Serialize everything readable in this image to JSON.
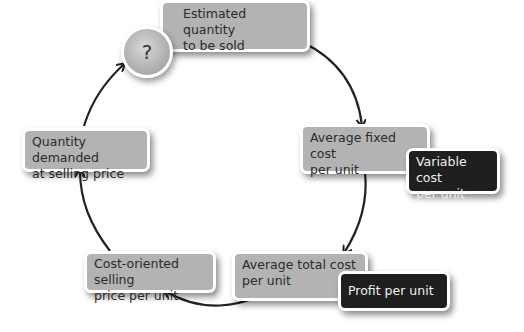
{
  "diagram": {
    "type": "cycle",
    "start_symbol": "?",
    "nodes": [
      {
        "id": "estimated_quantity",
        "label_line1": "Estimated quantity",
        "label_line2": "to be sold"
      },
      {
        "id": "average_fixed_cost",
        "label_line1": "Average fixed cost",
        "label_line2": "per unit"
      },
      {
        "id": "variable_cost",
        "label_line1": "Variable cost",
        "label_line2": "per unit"
      },
      {
        "id": "average_total_cost",
        "label_line1": "Average total cost",
        "label_line2": "per unit"
      },
      {
        "id": "profit_per_unit",
        "label_line1": "Profit per unit"
      },
      {
        "id": "cost_oriented_price",
        "label_line1": "Cost-oriented selling",
        "label_line2": "price per unit"
      },
      {
        "id": "quantity_demanded",
        "label_line1": "Quantity demanded",
        "label_line2": "at selling price"
      }
    ],
    "edges": [
      {
        "from": "estimated_quantity",
        "to": "average_fixed_cost"
      },
      {
        "from": "average_fixed_cost",
        "to": "average_total_cost"
      },
      {
        "from": "average_total_cost",
        "to": "cost_oriented_price"
      },
      {
        "from": "cost_oriented_price",
        "to": "quantity_demanded"
      },
      {
        "from": "quantity_demanded",
        "to": "estimated_quantity"
      }
    ],
    "colors": {
      "grey_box": "#b3b3b3",
      "dark_box": "#1f1f1f",
      "arrow": "#222222"
    }
  }
}
